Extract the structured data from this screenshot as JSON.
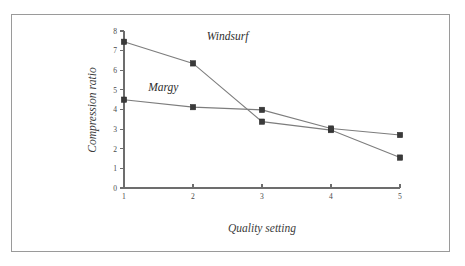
{
  "chart_data": {
    "type": "line",
    "title": "",
    "subtitle": "",
    "xlabel": "Quality setting",
    "ylabel": "Compression ratio",
    "x": [
      1,
      2,
      3,
      4,
      5
    ],
    "xtick_labels": [
      "1",
      "2",
      "3",
      "4",
      "5"
    ],
    "ytick_labels": [
      "0",
      "1",
      "2",
      "3",
      "4",
      "5",
      "6",
      "7",
      "8"
    ],
    "ytick_values": [
      0,
      1,
      2,
      3,
      4,
      5,
      6,
      7,
      8
    ],
    "xlim": [
      1,
      5
    ],
    "ylim": [
      0,
      8
    ],
    "grid": false,
    "legend_position": "inline-annotation",
    "series": [
      {
        "name": "Windsurf",
        "values": [
          7.45,
          6.35,
          3.38,
          2.95,
          1.55
        ],
        "color": "#7d7d7d",
        "marker": "square",
        "label_x": 2.2,
        "label_y": 7.55
      },
      {
        "name": "Margy",
        "values": [
          4.5,
          4.12,
          3.98,
          3.03,
          2.7
        ],
        "color": "#7d7d7d",
        "marker": "square",
        "label_x": 1.35,
        "label_y": 4.95
      }
    ],
    "annotations": [
      {
        "text": "Windsurf",
        "x": 2.2,
        "y": 7.55
      },
      {
        "text": "Margy",
        "x": 1.35,
        "y": 4.95
      }
    ],
    "colors": {
      "line": "#7d7d7d",
      "marker": "#3a3a3a",
      "axis": "#6d6d6d",
      "frame": "#9a9a9a",
      "text": "#3b3b3b",
      "background": "#ffffff"
    }
  },
  "figure": {
    "frame_visible": true,
    "background": "#ffffff"
  }
}
